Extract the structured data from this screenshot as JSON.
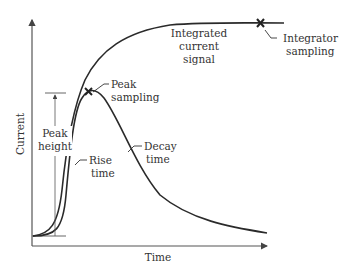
{
  "diagram": {
    "type": "pulse-signal-diagram",
    "axes": {
      "x_label": "Time",
      "y_label": "Current"
    },
    "curves": [
      {
        "name": "pulse-signal",
        "description": "Current pulse rising then exponentially decaying"
      },
      {
        "name": "integrated-current-signal",
        "description": "Integrated current rising to a plateau"
      }
    ],
    "annotations": {
      "integrated_line1": "Integrated",
      "integrated_line2": "current",
      "integrated_line3": "signal",
      "integrator_line1": "Integrator",
      "integrator_line2": "sampling",
      "peak_sampling_line1": "Peak",
      "peak_sampling_line2": "sampling",
      "peak_height_line1": "Peak",
      "peak_height_line2": "height",
      "rise_time_line1": "Rise",
      "rise_time_line2": "time",
      "decay_time_line1": "Decay",
      "decay_time_line2": "time"
    },
    "markers": [
      {
        "name": "peak-sampling-marker",
        "glyph": "x"
      },
      {
        "name": "integrator-sampling-marker",
        "glyph": "x"
      }
    ],
    "colors": {
      "line": "#2a2a2a",
      "axis": "#555555",
      "text": "#333333"
    }
  }
}
